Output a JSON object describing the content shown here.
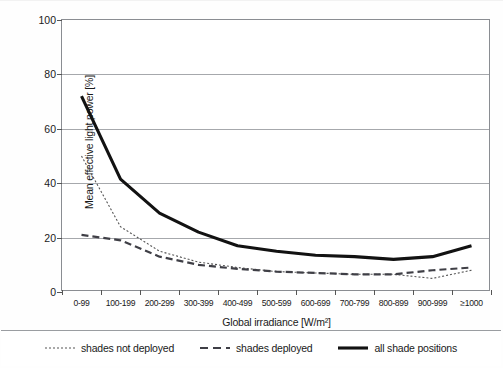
{
  "figure": {
    "background_color": "#ffffff",
    "axis_color": "#8a8d92",
    "grid_color": "#a6a8ac",
    "text_color": "#1a1a1a"
  },
  "chart_data": {
    "type": "line",
    "title": "",
    "xlabel": "Global irradiance [W/m²]",
    "ylabel": "Mean effective light power [%]",
    "categories": [
      "0-99",
      "100-199",
      "200-299",
      "300-399",
      "400-499",
      "500-599",
      "600-699",
      "700-799",
      "800-899",
      "900-999",
      "≥1000"
    ],
    "ylim": [
      0,
      100
    ],
    "yticks": [
      0,
      20,
      40,
      60,
      80,
      100
    ],
    "ytick_labels": [
      "0",
      "20",
      "40",
      "60",
      "80",
      "100"
    ],
    "grid": "horizontal",
    "legend_position": "below",
    "series": [
      {
        "name": "shades not deployed",
        "style": "dotted",
        "color": "#555555",
        "width": 1.1,
        "values": [
          50,
          24,
          15,
          11,
          9,
          7.5,
          7,
          6.5,
          6.5,
          5,
          8
        ]
      },
      {
        "name": "shades deployed",
        "style": "dashed",
        "color": "#3f3f46",
        "width": 2.2,
        "values": [
          21,
          19,
          13,
          10,
          8.5,
          7.5,
          7,
          6.5,
          6.5,
          8,
          9
        ]
      },
      {
        "name": "all shade positions",
        "style": "solid",
        "color": "#121212",
        "width": 3.1,
        "values": [
          72,
          41.5,
          29,
          22,
          17,
          15,
          13.5,
          13,
          12,
          13,
          17
        ]
      }
    ]
  },
  "legend": {
    "items": [
      {
        "label": "shades not deployed",
        "style": "dotted"
      },
      {
        "label": "shades deployed",
        "style": "dashed"
      },
      {
        "label": "all shade positions",
        "style": "solid"
      }
    ]
  }
}
